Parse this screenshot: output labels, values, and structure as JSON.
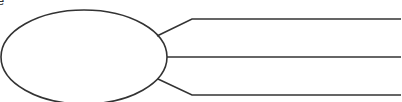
{
  "diagram": {
    "type": "graphic-organizer",
    "corner_text_fragment": "e",
    "stroke_color": "#333333",
    "background_color": "#ffffff",
    "oval": {
      "cx": 84,
      "cy": 57,
      "rx": 83,
      "ry": 47,
      "text": ""
    },
    "branches": [
      {
        "id": "top",
        "points": "157,36 192,19 401,19",
        "text": ""
      },
      {
        "id": "middle",
        "points": "167,57 401,57",
        "text": ""
      },
      {
        "id": "bottom",
        "points": "158,79 192,95 401,95",
        "text": ""
      }
    ]
  }
}
